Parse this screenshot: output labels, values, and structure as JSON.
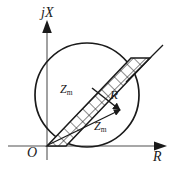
{
  "figure": {
    "kind": "impedance-plane-diagram",
    "background_color": "#ffffff",
    "stroke_color": "#1a1a1a",
    "axis_color": "#808080"
  },
  "axes": {
    "vertical": {
      "label": "jX",
      "label_symbol": "j",
      "label_variable": "X",
      "arrow": "up"
    },
    "horizontal": {
      "label": "R",
      "arrow": "right"
    },
    "origin": {
      "label": "O"
    }
  },
  "circle": {
    "center_x": 87,
    "center_y": 95,
    "radius": 52,
    "passes_through_origin": true
  },
  "band": {
    "description": "cross-hatched diagonal strip",
    "hatch_pattern": "mesh",
    "angle_deg": 45,
    "extends_beyond_circle": true
  },
  "vectors": [
    {
      "name": "R",
      "label": "R",
      "subscript": "",
      "from": "band-center",
      "to": "arrowhead-right"
    },
    {
      "name": "Zm-lower",
      "label": "Z",
      "subscript": "m",
      "from": "origin",
      "to": "arrowhead-right"
    }
  ],
  "labels": {
    "zm_upper": {
      "base": "Z",
      "sub": "m"
    },
    "zm_lower": {
      "base": "Z",
      "sub": "m"
    },
    "r_vector": "R",
    "r_axis": "R",
    "jx_axis": "jX",
    "origin": "O"
  }
}
